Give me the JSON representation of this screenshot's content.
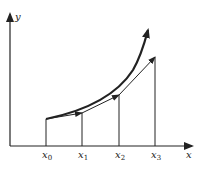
{
  "diagram": {
    "type": "euler-method-approximation",
    "axes": {
      "x_label": "x",
      "y_label": "y"
    },
    "x_ticks": [
      {
        "base": "x",
        "sub": "0"
      },
      {
        "base": "x",
        "sub": "1"
      },
      {
        "base": "x",
        "sub": "2"
      },
      {
        "base": "x",
        "sub": "3"
      }
    ],
    "elements": [
      "exact solution curve (bold, arrowhead)",
      "piecewise-linear Euler approximation with arrowheads",
      "vertical lines at x0, x1, x2, x3"
    ],
    "colors": {
      "ink": "#222222",
      "background": "#ffffff"
    }
  }
}
